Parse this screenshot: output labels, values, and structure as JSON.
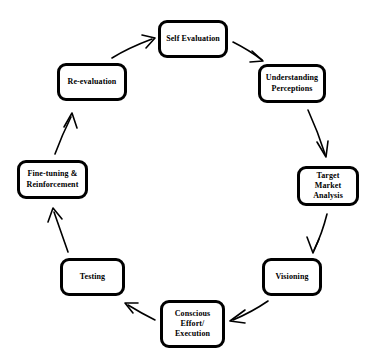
{
  "diagram": {
    "type": "cycle-flow-diagram",
    "title": "",
    "background_color": "#ffffff",
    "node_border_color": "#000000",
    "node_fill_color": "#ffffff",
    "arrow_color": "#000000",
    "direction": "clockwise",
    "nodes": [
      {
        "id": "self-evaluation",
        "label": "Self Evaluation",
        "order": 1,
        "x": 158,
        "y": 20,
        "width": 70,
        "height": 38
      },
      {
        "id": "understanding-perceptions",
        "label": "Understanding\nPerceptions",
        "order": 2,
        "x": 258,
        "y": 64,
        "width": 68,
        "height": 39
      },
      {
        "id": "target-market-analysis",
        "label": "Target Market\nAnalysis",
        "order": 3,
        "x": 297,
        "y": 166,
        "width": 62,
        "height": 40
      },
      {
        "id": "visioning",
        "label": "Visioning",
        "order": 4,
        "x": 262,
        "y": 258,
        "width": 60,
        "height": 38
      },
      {
        "id": "conscious-effort-execution",
        "label": "Conscious\nEffort/\nExecution",
        "order": 5,
        "x": 160,
        "y": 300,
        "width": 65,
        "height": 48
      },
      {
        "id": "testing",
        "label": "Testing",
        "order": 6,
        "x": 60,
        "y": 258,
        "width": 65,
        "height": 38
      },
      {
        "id": "fine-tuning-reinforcement",
        "label": "Fine-tuning &\nReinforcement",
        "order": 7,
        "x": 17,
        "y": 160,
        "width": 71,
        "height": 39
      },
      {
        "id": "re-evaluation",
        "label": "Re-evaluation",
        "order": 8,
        "x": 57,
        "y": 63,
        "width": 70,
        "height": 38
      }
    ],
    "edges": [
      {
        "id": "edge-self-evaluation-to-understanding-perceptions",
        "from": "self-evaluation",
        "to": "understanding-perceptions"
      },
      {
        "id": "edge-understanding-perceptions-to-target-market-analysis",
        "from": "understanding-perceptions",
        "to": "target-market-analysis"
      },
      {
        "id": "edge-target-market-analysis-to-visioning",
        "from": "target-market-analysis",
        "to": "visioning"
      },
      {
        "id": "edge-visioning-to-conscious-effort-execution",
        "from": "visioning",
        "to": "conscious-effort-execution"
      },
      {
        "id": "edge-conscious-effort-execution-to-testing",
        "from": "conscious-effort-execution",
        "to": "testing"
      },
      {
        "id": "edge-testing-to-fine-tuning-reinforcement",
        "from": "testing",
        "to": "fine-tuning-reinforcement"
      },
      {
        "id": "edge-fine-tuning-reinforcement-to-re-evaluation",
        "from": "fine-tuning-reinforcement",
        "to": "re-evaluation"
      },
      {
        "id": "edge-re-evaluation-to-self-evaluation",
        "from": "re-evaluation",
        "to": "self-evaluation"
      }
    ]
  }
}
